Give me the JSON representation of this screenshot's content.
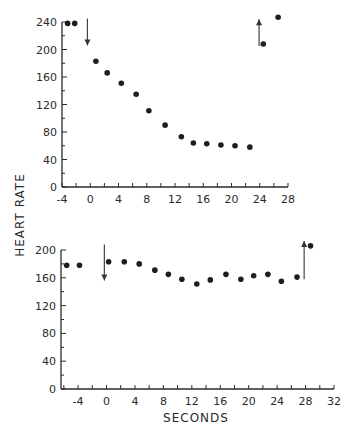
{
  "chart_data": [
    {
      "type": "scatter",
      "title": "",
      "xlabel": "",
      "ylabel": "HEART RATE",
      "xlim": [
        -4,
        28
      ],
      "ylim": [
        0,
        240
      ],
      "x_ticks": [
        -4,
        0,
        4,
        8,
        12,
        16,
        20,
        24,
        28
      ],
      "x_minor_step": 2,
      "y_ticks": [
        0,
        40,
        80,
        120,
        160,
        200,
        240
      ],
      "y_minor_step": 20,
      "grid": false,
      "series": [
        {
          "name": "heart rate",
          "x": [
            -3.2,
            -2.2,
            0.8,
            2.4,
            4.4,
            6.5,
            8.3,
            10.6,
            12.9,
            14.6,
            16.5,
            18.5,
            20.5,
            22.6,
            24.5,
            26.6
          ],
          "y": [
            238,
            238,
            183,
            166,
            151,
            135,
            111,
            90,
            73,
            64,
            63,
            61,
            60,
            58,
            208,
            247
          ]
        }
      ],
      "annotations": [
        {
          "type": "arrow-down",
          "x": -0.4,
          "y_from": 245,
          "y_to": 206
        },
        {
          "type": "arrow-up",
          "x": 23.9,
          "y_from": 205,
          "y_to": 244
        }
      ]
    },
    {
      "type": "scatter",
      "title": "",
      "xlabel": "SECONDS",
      "ylabel": "HEART RATE",
      "xlim": [
        -6.4,
        32
      ],
      "ylim": [
        0,
        200
      ],
      "x_ticks": [
        -4,
        0,
        4,
        8,
        12,
        16,
        20,
        24,
        28,
        32
      ],
      "x_minor_step": 2,
      "y_ticks": [
        0,
        40,
        80,
        120,
        160,
        200
      ],
      "y_minor_step": 20,
      "grid": false,
      "series": [
        {
          "name": "heart rate",
          "x": [
            -5.6,
            -3.8,
            0.3,
            2.5,
            4.6,
            6.8,
            8.7,
            10.6,
            12.7,
            14.6,
            16.8,
            18.9,
            20.7,
            22.7,
            24.6,
            26.8,
            28.7
          ],
          "y": [
            178,
            178,
            183,
            183,
            180,
            171,
            165,
            158,
            151,
            157,
            165,
            158,
            163,
            165,
            155,
            161,
            206
          ]
        }
      ],
      "annotations": [
        {
          "type": "arrow-down",
          "x": -0.3,
          "y_from": 208,
          "y_to": 156
        },
        {
          "type": "arrow-up",
          "x": 27.8,
          "y_from": 158,
          "y_to": 213
        }
      ]
    }
  ],
  "labels": {
    "y_axis_title": "HEART RATE",
    "x_axis_title": "SECONDS"
  }
}
